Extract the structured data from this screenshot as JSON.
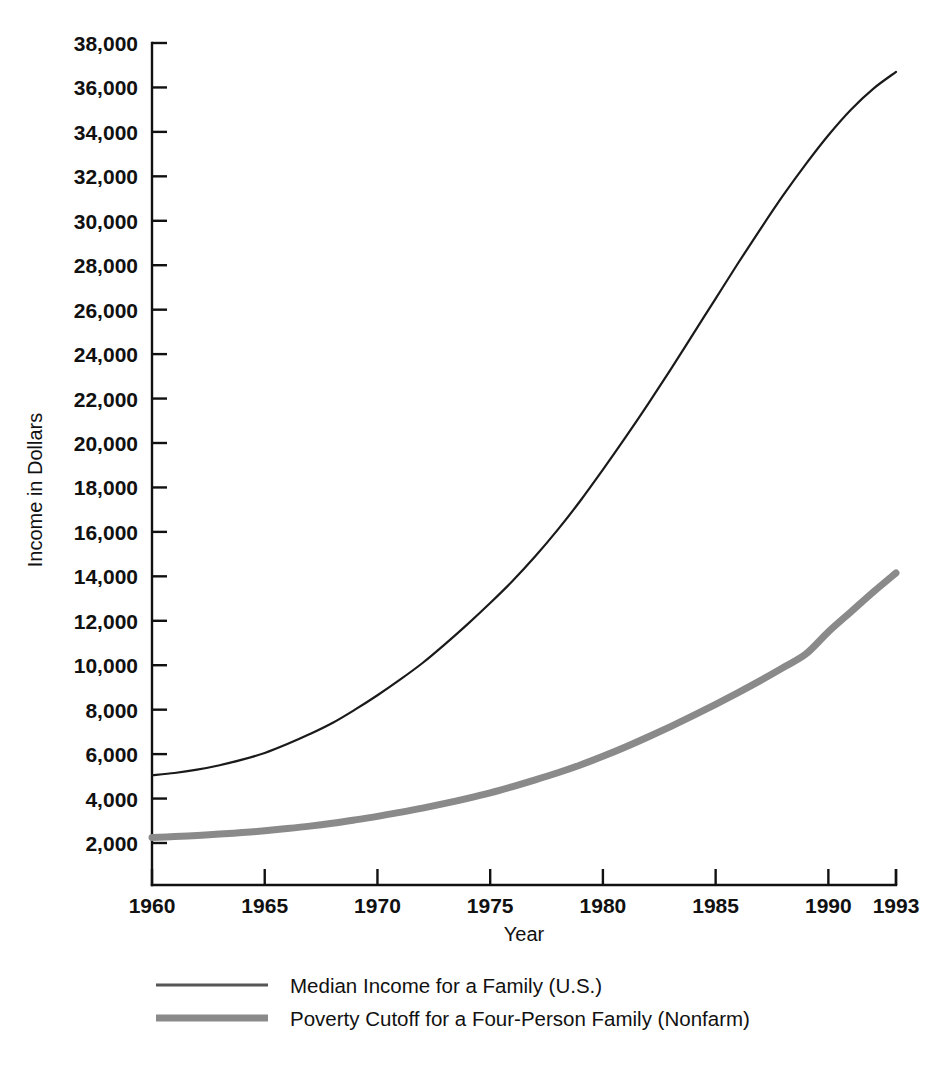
{
  "chart_data": {
    "type": "line",
    "title": "",
    "xlabel": "Year",
    "ylabel": "Income in Dollars",
    "xlim": [
      1960,
      1993
    ],
    "ylim": [
      2000,
      38000
    ],
    "grid": false,
    "legend_position": "bottom-left",
    "x_ticks": [
      "1960",
      "1965",
      "1970",
      "1975",
      "1980",
      "1985",
      "1990",
      "1993"
    ],
    "x_tick_values": [
      1960,
      1965,
      1970,
      1975,
      1980,
      1985,
      1990,
      1993
    ],
    "y_ticks": [
      "2,000",
      "4,000",
      "6,000",
      "8,000",
      "10,000",
      "12,000",
      "14,000",
      "16,000",
      "18,000",
      "20,000",
      "22,000",
      "24,000",
      "26,000",
      "28,000",
      "30,000",
      "32,000",
      "34,000",
      "36,000",
      "38,000"
    ],
    "y_tick_values": [
      2000,
      4000,
      6000,
      8000,
      10000,
      12000,
      14000,
      16000,
      18000,
      20000,
      22000,
      24000,
      26000,
      28000,
      30000,
      32000,
      34000,
      36000,
      38000
    ],
    "x": [
      1960,
      1961,
      1962,
      1963,
      1964,
      1965,
      1966,
      1967,
      1968,
      1969,
      1970,
      1971,
      1972,
      1973,
      1974,
      1975,
      1976,
      1977,
      1978,
      1979,
      1980,
      1981,
      1982,
      1983,
      1984,
      1985,
      1986,
      1987,
      1988,
      1989,
      1990,
      1991,
      1992,
      1993
    ],
    "series": [
      {
        "name": "Median Income for a Family (U.S.)",
        "color": "#1a1a1a",
        "line_width": 2.2,
        "values": [
          5050,
          5150,
          5300,
          5500,
          5750,
          6050,
          6450,
          6900,
          7400,
          8000,
          8650,
          9350,
          10100,
          10950,
          11850,
          12800,
          13800,
          14900,
          16100,
          17400,
          18800,
          20250,
          21750,
          23300,
          24900,
          26500,
          28100,
          29650,
          31150,
          32550,
          33850,
          35000,
          35950,
          36700
        ]
      },
      {
        "name": "Poverty Cutoff for a Four-Person Family (Nonfarm)",
        "color": "#8a8a8a",
        "line_width": 7.0,
        "values": [
          2250,
          2290,
          2340,
          2400,
          2470,
          2550,
          2650,
          2760,
          2890,
          3040,
          3200,
          3380,
          3570,
          3780,
          4010,
          4260,
          4540,
          4840,
          5160,
          5510,
          5900,
          6320,
          6770,
          7240,
          7730,
          8240,
          8770,
          9320,
          9900,
          10500,
          11500,
          12400,
          13300,
          14150
        ]
      }
    ]
  },
  "legend": {
    "entries": [
      {
        "label": "Median Income for a Family (U.S.)",
        "color": "#555555",
        "swatch": "thin-line-swatch"
      },
      {
        "label": "Poverty Cutoff for a Four-Person Family (Nonfarm)",
        "color": "#8a8a8a",
        "swatch": "thick-line-swatch"
      }
    ]
  }
}
